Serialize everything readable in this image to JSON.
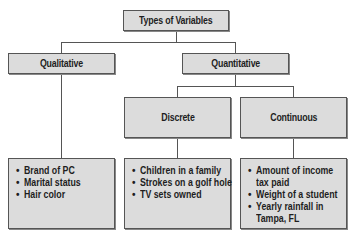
{
  "title": "Types of Variables",
  "nodes": {
    "qualitative": "Qualitative",
    "quantitative": "Quantitative",
    "discrete": "Discrete",
    "continuous": "Continuous"
  },
  "examples": {
    "qualitative": [
      "Brand of PC",
      "Marital status",
      "Hair color"
    ],
    "discrete": [
      "Children in a family",
      "Strokes on a golf hole",
      "TV sets owned"
    ],
    "continuous": [
      "Amount of income",
      "tax paid",
      "Weight of a student",
      "Yearly rainfall in",
      "Tampa, FL"
    ]
  },
  "bullet": "•",
  "colors": {
    "box_fill": "#dcdcdc",
    "border": "#555555"
  }
}
